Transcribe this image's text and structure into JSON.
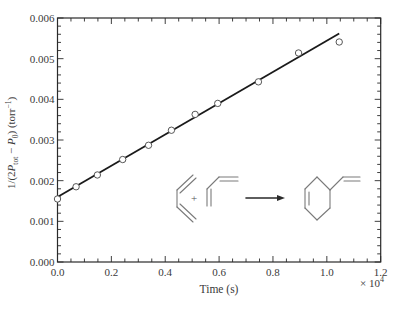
{
  "chart_data": {
    "type": "scatter",
    "title": "",
    "xlabel": "Time (s)",
    "x_multiplier_label": "× 10",
    "x_multiplier_exponent": "4",
    "ylabel_parts": [
      "1/(2",
      "P",
      "tot",
      " − ",
      "P",
      "0",
      ") (torr",
      "−1",
      ")"
    ],
    "xlim": [
      0.0,
      1.2
    ],
    "ylim": [
      0.0,
      0.006
    ],
    "x_ticks": [
      "0.0",
      "0.2",
      "0.4",
      "0.6",
      "0.8",
      "1.0",
      "1.2"
    ],
    "y_ticks": [
      "0.000",
      "0.001",
      "0.002",
      "0.003",
      "0.004",
      "0.005",
      "0.006"
    ],
    "x_minor_step": 0.05,
    "y_minor_step": 0.0002,
    "grid": false,
    "legend": null,
    "series": [
      {
        "name": "Measured 1/(2Ptot − P0)",
        "marker": "open-circle",
        "x": [
          0.0,
          0.069,
          0.148,
          0.242,
          0.338,
          0.423,
          0.511,
          0.595,
          0.746,
          0.895,
          1.046
        ],
        "y": [
          0.00155,
          0.00185,
          0.00214,
          0.00252,
          0.00287,
          0.00324,
          0.00363,
          0.0039,
          0.00443,
          0.00514,
          0.00541
        ]
      },
      {
        "name": "Linear fit",
        "marker": "line",
        "x": [
          0.0,
          1.046
        ],
        "y": [
          0.0016,
          0.00562
        ]
      }
    ],
    "annotations": [
      {
        "type": "reaction-scheme",
        "text": "butadiene + butadiene → 4-vinylcyclohexene",
        "plus": "+"
      }
    ]
  },
  "inset": {
    "plus": "+"
  }
}
